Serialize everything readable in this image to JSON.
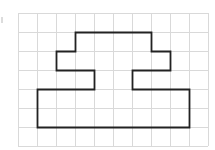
{
  "grid": {
    "columns": 10,
    "rows": 7,
    "cell_size": 19,
    "origin_x": 18,
    "origin_y": 13,
    "line_color": "#d9d9d9",
    "background": "#ffffff"
  },
  "shape": {
    "stroke_color": "#222222",
    "stroke_width": 1.8,
    "vertices": [
      [
        3,
        1
      ],
      [
        7,
        1
      ],
      [
        7,
        2
      ],
      [
        8,
        2
      ],
      [
        8,
        3
      ],
      [
        6,
        3
      ],
      [
        6,
        4
      ],
      [
        9,
        4
      ],
      [
        9,
        6
      ],
      [
        1,
        6
      ],
      [
        1,
        4
      ],
      [
        4,
        4
      ],
      [
        4,
        3
      ],
      [
        2,
        3
      ],
      [
        2,
        2
      ],
      [
        3,
        2
      ]
    ]
  }
}
